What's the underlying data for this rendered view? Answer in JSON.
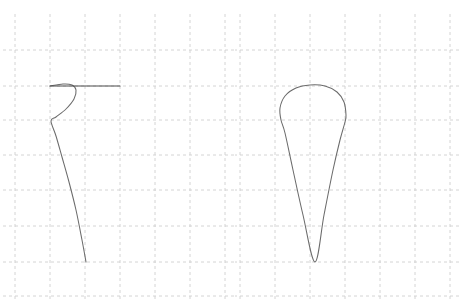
{
  "figure": {
    "title": "",
    "background_color": "#ffffff",
    "width": 469,
    "height": 306,
    "panel_count": 2
  },
  "style": {
    "grid_color": "#cfcfcf",
    "grid_dash": "3 3",
    "curve_color": "#6b6b6b",
    "accent_color": "#4a4a4a"
  },
  "chart_data": {
    "type": "line",
    "title": "",
    "subtitle": "",
    "xlabel": "",
    "ylabel": "",
    "grid": true,
    "legend": null,
    "panels": [
      {
        "name": "left-panel",
        "label": "",
        "grid": {
          "x_ticks": [
            15,
            50,
            85,
            120,
            155,
            190,
            225
          ],
          "y_ticks": [
            50,
            86,
            120,
            155,
            190,
            226,
            262,
            296
          ],
          "x_range": [
            15,
            225
          ],
          "y_range": [
            50,
            296
          ]
        },
        "series": [
          {
            "name": "open-teardrop-curve",
            "closed": false,
            "points": [
              [
                50,
                86
              ],
              [
                63,
                84
              ],
              [
                72,
                85
              ],
              [
                76,
                90
              ],
              [
                74,
                99
              ],
              [
                66,
                109
              ],
              [
                56,
                117
              ],
              [
                51,
                121
              ],
              [
                56,
                136
              ],
              [
                62,
                157
              ],
              [
                69,
                182
              ],
              [
                76,
                210
              ],
              [
                82,
                240
              ],
              [
                86,
                262
              ]
            ]
          },
          {
            "name": "horizontal-accent-segment",
            "closed": false,
            "points": [
              [
                50,
                86
              ],
              [
                120,
                86
              ]
            ]
          }
        ]
      },
      {
        "name": "right-panel",
        "label": "",
        "grid": {
          "x_ticks": [
            240,
            275,
            310,
            345,
            380,
            415,
            450
          ],
          "y_ticks": [
            50,
            86,
            120,
            155,
            190,
            226,
            262,
            296
          ],
          "x_range": [
            240,
            450
          ],
          "y_range": [
            50,
            296
          ]
        },
        "series": [
          {
            "name": "closed-teardrop-curve",
            "closed": true,
            "points": [
              [
                315,
                262
              ],
              [
                303,
                215
              ],
              [
                293,
                170
              ],
              [
                285,
                133
              ],
              [
                281,
                120
              ],
              [
                280,
                108
              ],
              [
                285,
                96
              ],
              [
                296,
                88
              ],
              [
                310,
                85
              ],
              [
                325,
                86
              ],
              [
                337,
                92
              ],
              [
                344,
                102
              ],
              [
                346,
                115
              ],
              [
                345,
                122
              ],
              [
                340,
                140
              ],
              [
                333,
                170
              ],
              [
                324,
                215
              ],
              [
                315,
                262
              ]
            ]
          }
        ]
      }
    ]
  }
}
